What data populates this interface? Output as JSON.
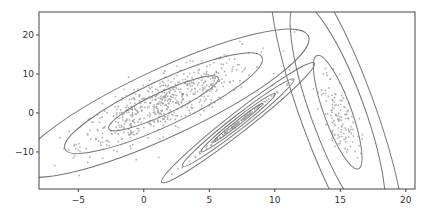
{
  "chart_data": {
    "type": "scatter",
    "title": "",
    "xlabel": "",
    "ylabel": "",
    "xlim": [
      -8,
      20.7
    ],
    "ylim": [
      -19.5,
      25.9
    ],
    "xticks": [
      -5,
      0,
      5,
      10,
      15,
      20
    ],
    "yticks": [
      -10,
      0,
      10,
      20
    ],
    "xtick_labels": [
      "−5",
      "0",
      "5",
      "10",
      "15",
      "20"
    ],
    "ytick_labels": [
      "−10",
      "0",
      "10",
      "20"
    ],
    "grid": false,
    "legend": null,
    "annotations": [],
    "point_color": "#999999",
    "contour_color": "#777777",
    "clusters": [
      {
        "name": "cluster-1",
        "center": [
          1.5,
          2.5
        ],
        "n_points": 600,
        "spread": [
          3.6,
          6.0
        ],
        "angle_deg": 25,
        "contours": [
          {
            "rx": 4.6,
            "ry": 1.8
          },
          {
            "rx": 8.3,
            "ry": 3.6
          },
          {
            "rx": 12.2,
            "ry": 5.4
          }
        ]
      },
      {
        "name": "cluster-2",
        "center": [
          7.2,
          -2.5
        ],
        "n_points": 120,
        "spread": [
          2.2,
          0.35
        ],
        "angle_deg": 38,
        "contours": [
          {
            "rx": 2.4,
            "ry": 0.35
          },
          {
            "rx": 3.6,
            "ry": 0.7
          },
          {
            "rx": 5.4,
            "ry": 1.1
          },
          {
            "rx": 7.4,
            "ry": 1.6
          }
        ]
      },
      {
        "name": "cluster-3",
        "center": [
          14.8,
          0.2
        ],
        "n_points": 130,
        "spread": [
          1.6,
          4.0
        ],
        "angle_deg": -70,
        "contours": [
          {
            "rx": 4.6,
            "ry": 2.2
          },
          {
            "rx": 9.0,
            "ry": 4.3
          },
          {
            "rx": 13.0,
            "ry": 6.0
          }
        ]
      }
    ]
  }
}
